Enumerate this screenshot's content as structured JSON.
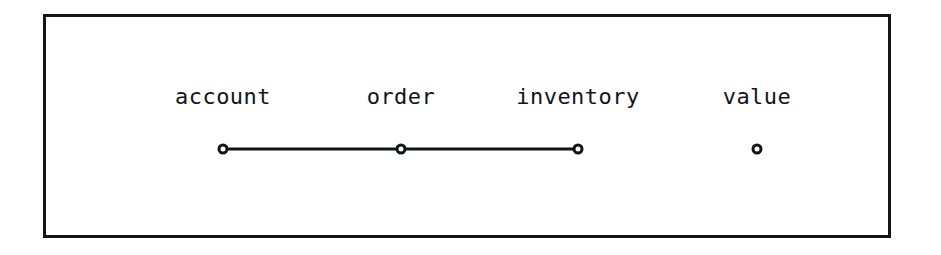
{
  "figure": {
    "frame": {
      "x": 43,
      "y": 14,
      "width": 848,
      "height": 224,
      "border_color": "#15161a",
      "border_width": 3,
      "background": "#ffffff"
    },
    "ink_color": "#131419",
    "page_background": "#ffffff"
  },
  "chart_data": {
    "type": "diagram",
    "title": "",
    "xlabel": "",
    "ylabel": "",
    "layout": "horizontal-node-link",
    "nodes": [
      {
        "id": "account",
        "label": "account",
        "x": 223,
        "y": 149,
        "marker": "open-circle",
        "connected": true
      },
      {
        "id": "order",
        "label": "order",
        "x": 401,
        "y": 149,
        "marker": "open-circle",
        "connected": true
      },
      {
        "id": "inventory",
        "label": "inventory",
        "x": 578,
        "y": 149,
        "marker": "open-circle",
        "connected": true
      },
      {
        "id": "value",
        "label": "value",
        "x": 757,
        "y": 149,
        "marker": "open-circle",
        "connected": false
      }
    ],
    "edges": [
      {
        "from": "account",
        "to": "order"
      },
      {
        "from": "order",
        "to": "inventory"
      }
    ],
    "label_baseline_y": 105,
    "marker_row_y": 149,
    "legend": [],
    "annotations": []
  }
}
